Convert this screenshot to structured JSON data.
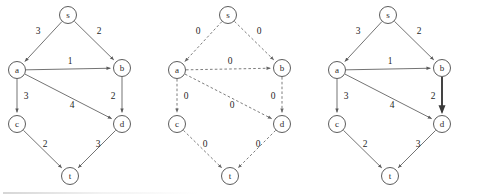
{
  "figure": {
    "title": "",
    "background_color": "#ffffff",
    "node_stroke_color": "#4a4a4a",
    "edge_color": "#5a5a5a",
    "highlight_color": "#3a3a3a",
    "panel_count": 3
  },
  "nodes": [
    {
      "id": "s",
      "label": "s",
      "x": 68,
      "y": 15,
      "r": 8.5
    },
    {
      "id": "a",
      "label": "a",
      "x": 17,
      "y": 70,
      "r": 8.5
    },
    {
      "id": "b",
      "label": "b",
      "x": 122,
      "y": 68,
      "r": 8.5
    },
    {
      "id": "c",
      "label": "c",
      "x": 17,
      "y": 124,
      "r": 8.5
    },
    {
      "id": "d",
      "label": "d",
      "x": 122,
      "y": 124,
      "r": 8.5
    },
    {
      "id": "t",
      "label": "t",
      "x": 70,
      "y": 176,
      "r": 8.5
    }
  ],
  "edges": [
    {
      "from": "s",
      "to": "a",
      "label_x": 38,
      "label_y": 32
    },
    {
      "from": "s",
      "to": "b",
      "label_x": 99,
      "label_y": 32
    },
    {
      "from": "a",
      "to": "b",
      "label_x": 70,
      "label_y": 62
    },
    {
      "from": "a",
      "to": "c",
      "label_x": 26,
      "label_y": 97
    },
    {
      "from": "a",
      "to": "d",
      "label_x": 72,
      "label_y": 106
    },
    {
      "from": "b",
      "to": "d",
      "label_x": 113,
      "label_y": 97
    },
    {
      "from": "c",
      "to": "t",
      "label_x": 45,
      "label_y": 145
    },
    {
      "from": "d",
      "to": "t",
      "label_x": 98,
      "label_y": 145
    }
  ],
  "panels": [
    {
      "name": "original-weighted-graph",
      "offset_x": 0,
      "style": "solid",
      "weights": {
        "s-a": "3",
        "s-b": "2",
        "a-b": "1",
        "a-c": "3",
        "a-d": "4",
        "b-d": "2",
        "c-t": "2",
        "d-t": "3"
      },
      "highlighted": []
    },
    {
      "name": "zero-initialized-graph",
      "offset_x": 160,
      "style": "dashed",
      "weights": {
        "s-a": "0",
        "s-b": "0",
        "a-b": "0",
        "a-c": "0",
        "a-d": "0",
        "b-d": "0",
        "c-t": "0",
        "d-t": "0"
      },
      "highlighted": []
    },
    {
      "name": "highlighted-path-graph",
      "offset_x": 320,
      "style": "solid",
      "weights": {
        "s-a": "3",
        "s-b": "2",
        "a-b": "1",
        "a-c": "3",
        "a-d": "4",
        "b-d": "2",
        "c-t": "2",
        "d-t": "3"
      },
      "highlighted": [
        "b-d"
      ]
    }
  ]
}
